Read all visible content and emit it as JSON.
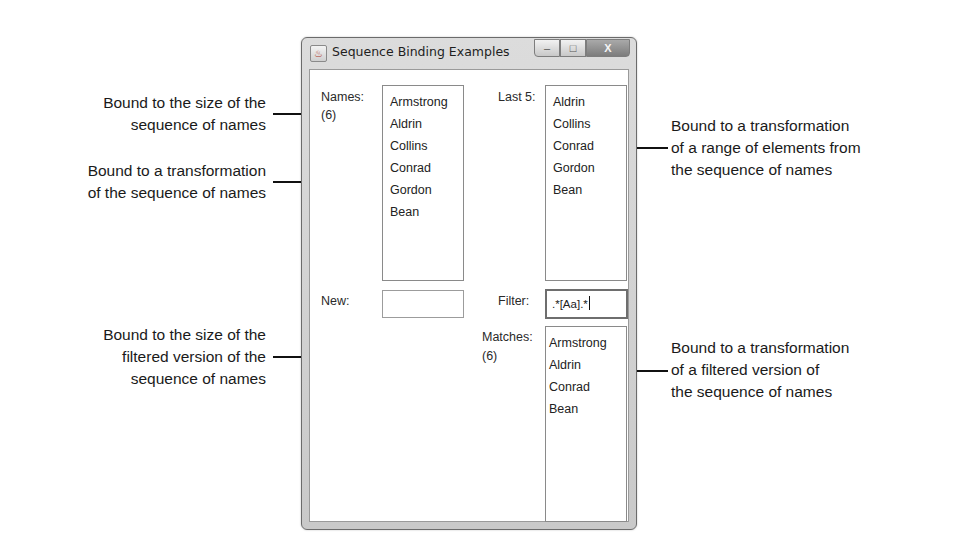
{
  "window": {
    "title": "Sequence Binding Examples",
    "controls": {
      "minimize": "–",
      "maximize": "□",
      "close": "X"
    }
  },
  "form": {
    "names_label": "Names:",
    "names_count": "(6)",
    "names_items": [
      "Armstrong",
      "Aldrin",
      "Collins",
      "Conrad",
      "Gordon",
      "Bean"
    ],
    "last5_label": "Last 5:",
    "last5_items": [
      "Aldrin",
      "Collins",
      "Conrad",
      "Gordon",
      "Bean"
    ],
    "new_label": "New:",
    "new_value": "",
    "filter_label": "Filter:",
    "filter_value": ".*[Aa].*",
    "matches_label": "Matches:",
    "matches_count": "(6)",
    "matches_items": [
      "Armstrong",
      "Aldrin",
      "Conrad",
      "Bean"
    ]
  },
  "callouts": {
    "names_count": [
      "Bound to the size of the",
      "sequence of names"
    ],
    "names_list": [
      "Bound to a transformation",
      "of the sequence of names"
    ],
    "last5_list": [
      "Bound to a transformation",
      "of a range of elements from",
      "the sequence of names"
    ],
    "matches_count": [
      "Bound to the size of the",
      "filtered version of the",
      "sequence of names"
    ],
    "matches_list": [
      "Bound to a transformation",
      "of a filtered version of",
      "the sequence of names"
    ]
  }
}
